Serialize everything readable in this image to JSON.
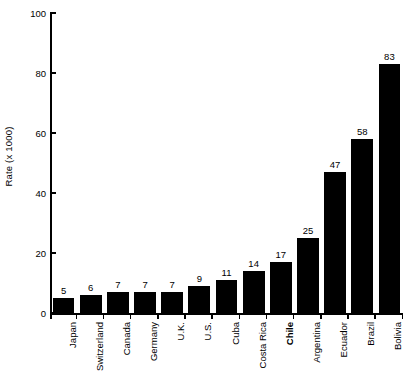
{
  "chart_data": {
    "type": "bar",
    "title": "",
    "subtitle": "",
    "xlabel": "",
    "ylabel": "Rate (x 1000)",
    "categories": [
      "Japan",
      "Switzerland",
      "Canada",
      "Germany",
      "U.K.",
      "U.S.",
      "Cuba",
      "Costa Rica",
      "Chile",
      "Argentina",
      "Ecuador",
      "Brazil",
      "Bolivia"
    ],
    "values": [
      5,
      6,
      7,
      7,
      7,
      9,
      11,
      14,
      17,
      25,
      47,
      58,
      83
    ],
    "data_labels": [
      "5",
      "6",
      "7",
      "7",
      "7",
      "9",
      "11",
      "14",
      "17",
      "25",
      "47",
      "58",
      "83"
    ],
    "highlighted_categories": [
      "Chile"
    ],
    "ylim": [
      0,
      100
    ],
    "ytick_labels": [
      "0",
      "20",
      "40",
      "60",
      "80",
      "100"
    ],
    "ytick_values": [
      0,
      20,
      40,
      60,
      80,
      100
    ],
    "grid": false,
    "legend": null,
    "bar_color": "#000000",
    "background_color": "#ffffff",
    "axis_color": "#000000"
  }
}
